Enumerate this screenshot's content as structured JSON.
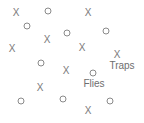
{
  "diagram": {
    "colors": {
      "mark": "#7a7a7a",
      "label": "#6e6e6e",
      "background": "#ffffff"
    },
    "traps": [
      {
        "x": 16,
        "y": 13
      },
      {
        "x": 88,
        "y": 13
      },
      {
        "x": 47,
        "y": 40
      },
      {
        "x": 12,
        "y": 49
      },
      {
        "x": 82,
        "y": 48
      },
      {
        "x": 117,
        "y": 55
      },
      {
        "x": 66,
        "y": 71
      },
      {
        "x": 40,
        "y": 88
      },
      {
        "x": 88,
        "y": 111
      }
    ],
    "flies": [
      {
        "x": 48,
        "y": 11
      },
      {
        "x": 27,
        "y": 26
      },
      {
        "x": 67,
        "y": 33
      },
      {
        "x": 106,
        "y": 31
      },
      {
        "x": 41,
        "y": 63
      },
      {
        "x": 93,
        "y": 73
      },
      {
        "x": 21,
        "y": 101
      },
      {
        "x": 63,
        "y": 99
      },
      {
        "x": 110,
        "y": 101
      }
    ],
    "trap_glyph": "X",
    "labels": {
      "traps": {
        "text": "Traps",
        "x": 122,
        "y": 66
      },
      "flies": {
        "text": "Flies",
        "x": 94,
        "y": 84
      }
    }
  }
}
